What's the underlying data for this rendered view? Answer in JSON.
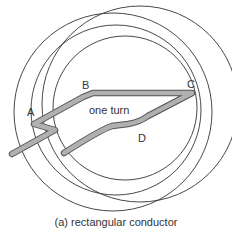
{
  "diagram": {
    "labels": {
      "A": "A",
      "B": "B",
      "C": "C",
      "D": "D",
      "turn": "one turn"
    },
    "caption": "(a) rectangular conductor",
    "colors": {
      "line": "#333333",
      "conductor_fill": "#b0b0b0",
      "conductor_edge": "#555555",
      "background": "#ffffff"
    }
  }
}
